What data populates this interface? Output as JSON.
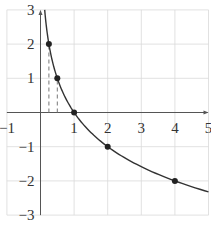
{
  "chart_data": {
    "type": "line",
    "title": "",
    "xlabel": "",
    "ylabel": "",
    "xlim": [
      -1,
      5
    ],
    "ylim": [
      -3,
      3
    ],
    "grid": true,
    "function": "y = log_{1/2}(x)",
    "xticks": [
      -1,
      1,
      2,
      3,
      4,
      5
    ],
    "yticks": [
      -3,
      -2,
      -1,
      1,
      2,
      3
    ],
    "xtick_labels": [
      "−1",
      "1",
      "2",
      "3",
      "4",
      "5"
    ],
    "ytick_labels": [
      "−3",
      "−2",
      "−1",
      "1",
      "2",
      "3"
    ],
    "series": [
      {
        "name": "curve",
        "x": [
          0.125,
          0.25,
          0.5,
          1,
          2,
          3,
          4,
          5
        ],
        "y": [
          3,
          2,
          1,
          0,
          -1,
          -1.585,
          -2,
          -2.322
        ]
      }
    ],
    "points": [
      {
        "x": 0.25,
        "y": 2
      },
      {
        "x": 0.5,
        "y": 1
      },
      {
        "x": 1,
        "y": 0
      },
      {
        "x": 2,
        "y": -1
      },
      {
        "x": 4,
        "y": -2
      }
    ],
    "dashed_guides": [
      {
        "x": 0.25,
        "from_y": 0,
        "to_y": 2
      },
      {
        "x": 0.5,
        "from_y": 0,
        "to_y": 1
      }
    ],
    "colors": {
      "grid": "#d9d9d9",
      "axis": "#555555",
      "curve": "#333333",
      "point": "#222222",
      "dashed": "#777777"
    }
  }
}
